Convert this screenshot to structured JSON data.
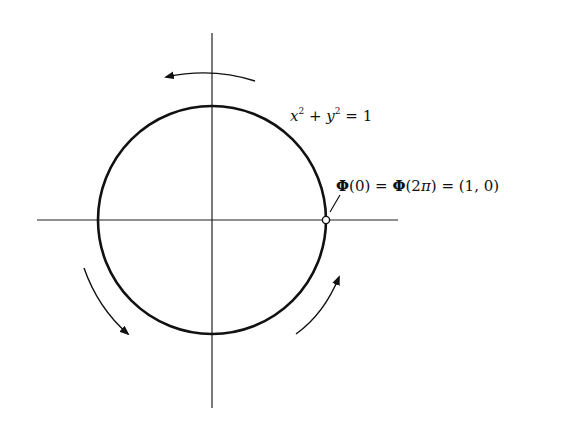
{
  "diagram": {
    "type": "parametrized unit circle",
    "axes": {
      "horizontal": {
        "x1": 37,
        "x2": 398,
        "y": 220
      },
      "vertical": {
        "x": 212,
        "y1": 33,
        "y2": 408
      }
    },
    "circle": {
      "cx": 212,
      "cy": 220,
      "r": 114,
      "equation_label": {
        "x_var": "x",
        "sup1": "2",
        "plus": " + ",
        "y_var": "y",
        "sup2": "2",
        "equals": " = 1"
      }
    },
    "marked_point": {
      "cx": 326,
      "cy": 220,
      "label": {
        "phi1": "Φ",
        "arg1": "(0)",
        "eq1": " = ",
        "phi2": "Φ",
        "arg2_open": "(2",
        "pi": "π",
        "arg2_close": ")",
        "eq2": " = ",
        "value": "(1, 0)"
      }
    },
    "arrows": [
      {
        "name": "top-arrow",
        "direction": "counterclockwise",
        "position": "top"
      },
      {
        "name": "lower-left-arrow",
        "direction": "counterclockwise",
        "position": "lower-left"
      },
      {
        "name": "lower-right-arrow",
        "direction": "counterclockwise",
        "position": "lower-right"
      }
    ],
    "colors": {
      "stroke": "#111111",
      "background": "#ffffff"
    }
  }
}
